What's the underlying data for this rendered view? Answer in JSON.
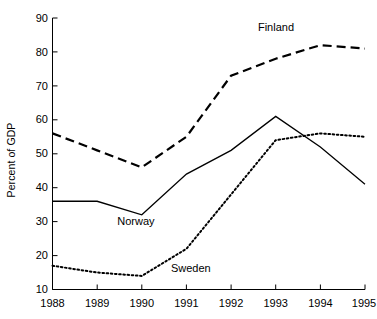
{
  "chart_data": {
    "type": "line",
    "title": "",
    "xlabel": "",
    "ylabel": "Percent of GDP",
    "categories": [
      "1988",
      "1989",
      "1990",
      "1991",
      "1992",
      "1993",
      "1994",
      "1995"
    ],
    "x": [
      1988,
      1989,
      1990,
      1991,
      1992,
      1993,
      1994,
      1995
    ],
    "xlim": [
      1988,
      1995
    ],
    "ylim": [
      10,
      90
    ],
    "yticks": [
      10,
      20,
      30,
      40,
      50,
      60,
      70,
      80,
      90
    ],
    "ytick_labels": [
      "10",
      "20",
      "30",
      "40",
      "50",
      "60",
      "70",
      "80",
      "90"
    ],
    "grid": false,
    "legend_position": "inline-annotations",
    "series": [
      {
        "name": "Finland",
        "style": "dashed",
        "color": "#000000",
        "values": [
          56,
          51,
          46,
          55,
          73,
          78,
          82,
          81
        ],
        "label_text": "Finland",
        "label_x": 1993.05,
        "label_y": 87
      },
      {
        "name": "Norway",
        "style": "solid",
        "color": "#000000",
        "values": [
          36,
          36,
          32,
          44,
          51,
          61,
          52,
          41
        ],
        "label_text": "Norway",
        "label_x": 1989.9,
        "label_y": 30
      },
      {
        "name": "Sweden",
        "style": "dotted",
        "color": "#000000",
        "values": [
          17,
          15,
          14,
          22,
          38,
          54,
          56,
          55
        ],
        "label_text": "Sweden",
        "label_x": 1991.1,
        "label_y": 16
      }
    ],
    "axis_color": "#000000"
  }
}
